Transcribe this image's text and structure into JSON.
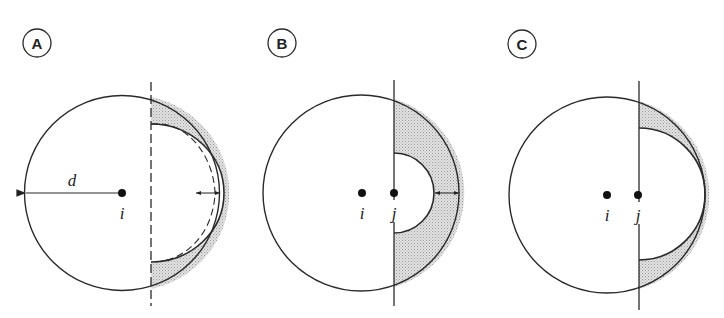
{
  "panels": [
    {
      "label": "A",
      "point_i": "i",
      "dimension": "d",
      "boundary": "dashed"
    },
    {
      "label": "B",
      "point_i": "i",
      "point_j": "j",
      "boundary": "solid"
    },
    {
      "label": "C",
      "point_i": "i",
      "point_j": "j",
      "boundary": "solid"
    }
  ],
  "colors": {
    "stroke": "#2a2a2a",
    "shade": "#d6d6d6",
    "background": "#ffffff"
  }
}
